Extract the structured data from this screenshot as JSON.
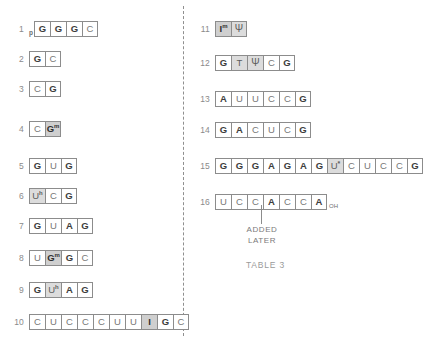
{
  "figure": {
    "caption": "TABLE 3",
    "annotation": {
      "text": "ADDED\nLATER"
    }
  },
  "left_column": {
    "rows": [
      {
        "number": "1",
        "prefix": "p",
        "bases": [
          {
            "label": "G",
            "style": "bold"
          },
          {
            "label": "G",
            "style": "bold"
          },
          {
            "label": "G",
            "style": "bold"
          },
          {
            "label": "C",
            "style": "plain"
          }
        ]
      },
      {
        "number": "2",
        "bases": [
          {
            "label": "G",
            "style": "bold"
          },
          {
            "label": "C",
            "style": "plain"
          }
        ]
      },
      {
        "number": "3",
        "bases": [
          {
            "label": "C",
            "style": "plain"
          },
          {
            "label": "G",
            "style": "bold"
          }
        ]
      },
      {
        "number": "4",
        "bases": [
          {
            "label": "C",
            "style": "plain"
          },
          {
            "label": "G",
            "sup": "m",
            "style": "shaded"
          }
        ]
      },
      {
        "number": "5",
        "bases": [
          {
            "label": "G",
            "style": "bold"
          },
          {
            "label": "U",
            "style": "plain"
          },
          {
            "label": "G",
            "style": "bold"
          }
        ]
      },
      {
        "number": "6",
        "bases": [
          {
            "label": "U",
            "sup": "h",
            "style": "shaded-light"
          },
          {
            "label": "C",
            "style": "plain"
          },
          {
            "label": "G",
            "style": "bold"
          }
        ]
      },
      {
        "number": "7",
        "bases": [
          {
            "label": "G",
            "style": "bold"
          },
          {
            "label": "U",
            "style": "plain"
          },
          {
            "label": "A",
            "style": "bold"
          },
          {
            "label": "G",
            "style": "bold"
          }
        ]
      },
      {
        "number": "8",
        "bases": [
          {
            "label": "U",
            "style": "plain"
          },
          {
            "label": "G",
            "sup": "m",
            "style": "shaded"
          },
          {
            "label": "G",
            "style": "bold"
          },
          {
            "label": "C",
            "style": "plain"
          }
        ]
      },
      {
        "number": "9",
        "bases": [
          {
            "label": "G",
            "style": "bold"
          },
          {
            "label": "U",
            "sup": "h",
            "style": "shaded-light"
          },
          {
            "label": "A",
            "style": "bold"
          },
          {
            "label": "G",
            "style": "bold"
          }
        ]
      },
      {
        "number": "10",
        "bases": [
          {
            "label": "C",
            "style": "plain"
          },
          {
            "label": "U",
            "style": "plain"
          },
          {
            "label": "C",
            "style": "plain"
          },
          {
            "label": "C",
            "style": "plain"
          },
          {
            "label": "C",
            "style": "plain"
          },
          {
            "label": "U",
            "style": "plain"
          },
          {
            "label": "U",
            "style": "plain"
          },
          {
            "label": "I",
            "style": "shaded"
          },
          {
            "label": "G",
            "style": "bold"
          },
          {
            "label": "C",
            "style": "plain"
          }
        ]
      }
    ]
  },
  "right_column": {
    "rows": [
      {
        "number": "11",
        "bases": [
          {
            "label": "I",
            "sup": "m",
            "style": "shaded"
          },
          {
            "label": "Ψ",
            "style": "shaded-light"
          }
        ]
      },
      {
        "number": "12",
        "bases": [
          {
            "label": "G",
            "style": "bold"
          },
          {
            "label": "T",
            "style": "shaded-light"
          },
          {
            "label": "Ψ",
            "style": "shaded-light"
          },
          {
            "label": "C",
            "style": "plain"
          },
          {
            "label": "G",
            "style": "bold"
          }
        ]
      },
      {
        "number": "13",
        "bases": [
          {
            "label": "A",
            "style": "bold"
          },
          {
            "label": "U",
            "style": "plain"
          },
          {
            "label": "U",
            "style": "plain"
          },
          {
            "label": "C",
            "style": "plain"
          },
          {
            "label": "C",
            "style": "plain"
          },
          {
            "label": "G",
            "style": "bold"
          }
        ]
      },
      {
        "number": "14",
        "bases": [
          {
            "label": "G",
            "style": "bold"
          },
          {
            "label": "A",
            "style": "bold"
          },
          {
            "label": "C",
            "style": "plain"
          },
          {
            "label": "U",
            "style": "plain"
          },
          {
            "label": "C",
            "style": "plain"
          },
          {
            "label": "G",
            "style": "bold"
          }
        ]
      },
      {
        "number": "15",
        "bases": [
          {
            "label": "G",
            "style": "bold"
          },
          {
            "label": "G",
            "style": "bold"
          },
          {
            "label": "G",
            "style": "bold"
          },
          {
            "label": "A",
            "style": "bold"
          },
          {
            "label": "G",
            "style": "bold"
          },
          {
            "label": "A",
            "style": "bold"
          },
          {
            "label": "G",
            "style": "bold"
          },
          {
            "label": "U",
            "star": "*",
            "style": "shaded-light"
          },
          {
            "label": "C",
            "style": "plain"
          },
          {
            "label": "U",
            "style": "plain"
          },
          {
            "label": "C",
            "style": "plain"
          },
          {
            "label": "C",
            "style": "plain"
          },
          {
            "label": "G",
            "style": "bold"
          }
        ]
      },
      {
        "number": "16",
        "suffix": "OH",
        "bases": [
          {
            "label": "U",
            "style": "plain"
          },
          {
            "label": "C",
            "style": "plain"
          },
          {
            "label": "C",
            "style": "plain"
          },
          {
            "label": "A",
            "style": "bold"
          },
          {
            "label": "C",
            "style": "plain"
          },
          {
            "label": "C",
            "style": "plain"
          },
          {
            "label": "A",
            "style": "bold"
          }
        ]
      }
    ]
  }
}
